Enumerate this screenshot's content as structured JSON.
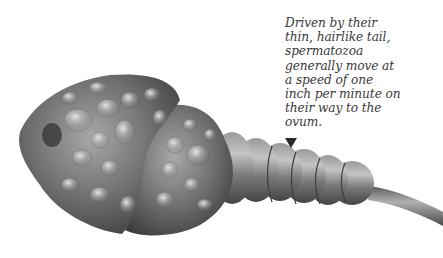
{
  "caption": {
    "text": "Driven by their\nthin, hairlike tail,\nspermatozoa\ngenerally move at\na speed of one\ninch per minute on\ntheir way to the\novum."
  },
  "illustration": {
    "subject": "spermatozoon",
    "parts": [
      "head",
      "midpiece",
      "tail"
    ],
    "pointer_icon": "down-triangle"
  },
  "colors": {
    "text": "#3a3a3a",
    "pointer": "#2a2a2a",
    "body_mid": "#7a7a7a",
    "body_dark": "#3c3c3c",
    "body_light": "#d8d8d8"
  }
}
